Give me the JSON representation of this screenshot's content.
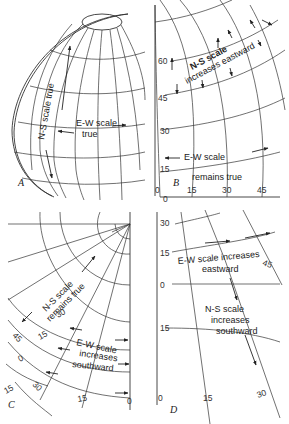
{
  "panels": {
    "A": {
      "label": "A",
      "ns_text": "N-S scale true",
      "ew_line1": "E-W scale",
      "ew_line2": "true"
    },
    "B": {
      "label": "B",
      "ns_line1": "N-S scale",
      "ns_line2": "increases eastward",
      "ew_line1": "E-W scale",
      "ew_line2": "remains true",
      "lat_ticks": [
        "60",
        "45",
        "30",
        "15",
        "0"
      ],
      "lon_ticks": [
        "0",
        "15",
        "30",
        "45"
      ]
    },
    "C": {
      "label": "C",
      "ns_line1": "N-S scale",
      "ns_line2": "remains true",
      "ew_line1": "E-W scale",
      "ew_line2": "increases",
      "ew_line3": "southward",
      "lat_ticks": [
        "30",
        "15",
        "0",
        "15"
      ],
      "lon_ticks": [
        "45",
        "30",
        "15",
        "0"
      ]
    },
    "D": {
      "label": "D",
      "ew_line1": "E-W scale increases",
      "ew_line2": "eastward",
      "ns_line1": "N-S scale",
      "ns_line2": "increases",
      "ns_line3": "southward",
      "lat_ticks": [
        "30",
        "15",
        "0",
        "15"
      ],
      "lon_ticks": [
        "0",
        "15",
        "30",
        "45"
      ]
    }
  }
}
